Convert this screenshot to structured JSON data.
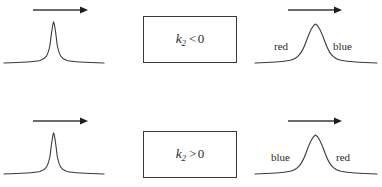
{
  "figure": {
    "name": "pulse-chirp-propagation-figure",
    "width": 382,
    "height": 187,
    "background": "#ffffff",
    "ink": "#3a3a3a"
  },
  "rows": [
    {
      "id": "row-negative-gvd",
      "input": {
        "arrow": "propagation-direction-arrow",
        "arrow_label": "",
        "pulse": "narrow-input-pulse"
      },
      "medium": {
        "equation_var": "k",
        "equation_sub": "2",
        "equation_rel": "<",
        "equation_num": "0",
        "equation_text": "k2 < 0"
      },
      "output": {
        "arrow": "propagation-direction-arrow",
        "pulse": "broadened-output-pulse",
        "leading_label": "red",
        "trailing_label": "blue"
      }
    },
    {
      "id": "row-positive-gvd",
      "input": {
        "arrow": "propagation-direction-arrow",
        "arrow_label": "",
        "pulse": "narrow-input-pulse"
      },
      "medium": {
        "equation_var": "k",
        "equation_sub": "2",
        "equation_rel": ">",
        "equation_num": "0",
        "equation_text": "k2 > 0"
      },
      "output": {
        "arrow": "propagation-direction-arrow",
        "pulse": "broadened-output-pulse",
        "leading_label": "blue",
        "trailing_label": "red"
      }
    }
  ]
}
